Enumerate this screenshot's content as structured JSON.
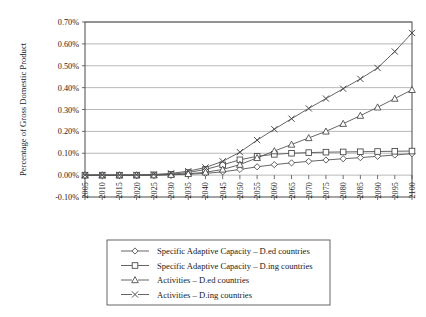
{
  "chart_data": {
    "type": "line",
    "title": "",
    "xlabel": "",
    "ylabel": "Percentage of Gross Domestic Product",
    "ylim": [
      -0.1,
      0.7
    ],
    "ytick_labels": [
      "0.70%",
      "0.60%",
      "0.50%",
      "0.40%",
      "0.30%",
      "0.20%",
      "0.10%",
      "0.00%",
      "-0.10%"
    ],
    "ytick_values": [
      0.7,
      0.6,
      0.5,
      0.4,
      0.3,
      0.2,
      0.1,
      0.0,
      -0.1
    ],
    "grid": true,
    "legend_position": "below",
    "categories": [
      "2005",
      "2010",
      "2015",
      "2020",
      "2025",
      "2030",
      "2035",
      "2040",
      "2045",
      "2050",
      "2055",
      "2060",
      "2065",
      "2070",
      "2075",
      "2080",
      "2085",
      "2090",
      "2095",
      "2100"
    ],
    "series": [
      {
        "name": "Specific Adaptive Capacity – D.ed countries",
        "marker": "diamond",
        "values": [
          0.0,
          0.0,
          0.0,
          0.0,
          0.0,
          0.002,
          0.004,
          0.008,
          0.015,
          0.026,
          0.038,
          0.048,
          0.056,
          0.063,
          0.069,
          0.075,
          0.08,
          0.086,
          0.092,
          0.098
        ]
      },
      {
        "name": "Specific Adaptive Capacity – D.ing countries",
        "marker": "square",
        "values": [
          0.0,
          0.0,
          0.0,
          0.0,
          0.001,
          0.004,
          0.012,
          0.026,
          0.047,
          0.07,
          0.086,
          0.095,
          0.1,
          0.103,
          0.105,
          0.106,
          0.107,
          0.108,
          0.109,
          0.11
        ]
      },
      {
        "name": "Activities – D.ed countries",
        "marker": "triangle",
        "values": [
          0.0,
          0.0,
          0.0,
          0.0,
          0.0,
          0.002,
          0.006,
          0.013,
          0.026,
          0.048,
          0.079,
          0.11,
          0.14,
          0.17,
          0.2,
          0.235,
          0.272,
          0.31,
          0.35,
          0.39
        ]
      },
      {
        "name": "Activities – D.ing countries",
        "marker": "cross",
        "values": [
          0.0,
          0.0,
          0.0,
          0.001,
          0.003,
          0.008,
          0.018,
          0.035,
          0.063,
          0.105,
          0.16,
          0.21,
          0.258,
          0.305,
          0.35,
          0.395,
          0.44,
          0.49,
          0.565,
          0.65
        ]
      }
    ]
  },
  "legend": {
    "items": [
      {
        "label": "Specific Adaptive Capacity – D.ed countries",
        "marker": "diamond"
      },
      {
        "label": "Specific Adaptive Capacity – D.ing countries",
        "marker": "square"
      },
      {
        "label": "Activities – D.ed countries",
        "marker": "triangle"
      },
      {
        "label": "Activities – D.ing countries",
        "marker": "cross"
      }
    ]
  },
  "colors": {
    "line": "#555555",
    "marker_stroke": "#444444",
    "grid": "#9a9a9a",
    "axis": "#4a4a4a"
  }
}
